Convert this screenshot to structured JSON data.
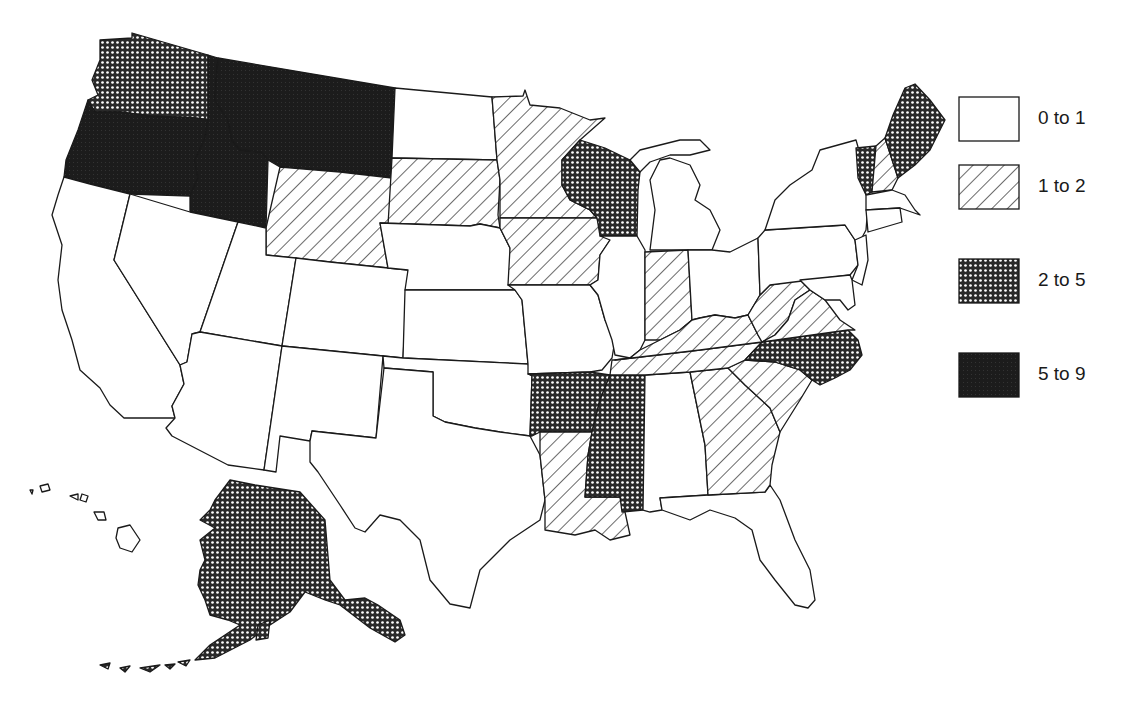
{
  "map": {
    "type": "choropleth",
    "region": "United States",
    "legend": [
      {
        "id": "c0",
        "label": "0 to 1",
        "pattern": "blank",
        "color": "#ffffff"
      },
      {
        "id": "c1",
        "label": "1 to 2",
        "pattern": "diagonal-hatch",
        "color": "#ffffff"
      },
      {
        "id": "c2",
        "label": "2 to 5",
        "pattern": "cross-hatch",
        "color": "#3a3a3a"
      },
      {
        "id": "c3",
        "label": "5 to 9",
        "pattern": "solid",
        "color": "#1c1c1c"
      }
    ],
    "states": {
      "5 to 9": [
        "Oregon",
        "Idaho",
        "Montana"
      ],
      "2 to 5": [
        "Washington",
        "Wisconsin",
        "Arkansas",
        "Mississippi",
        "North Carolina",
        "Vermont",
        "Maine",
        "Alaska"
      ],
      "1 to 2": [
        "Wyoming",
        "South Dakota",
        "Minnesota",
        "Iowa",
        "Indiana",
        "Kentucky",
        "Tennessee",
        "West Virginia",
        "Virginia",
        "Louisiana",
        "Georgia",
        "South Carolina",
        "New Hampshire"
      ],
      "0 to 1": [
        "California",
        "Nevada",
        "Utah",
        "Arizona",
        "Colorado",
        "New Mexico",
        "North Dakota",
        "Nebraska",
        "Kansas",
        "Oklahoma",
        "Texas",
        "Missouri",
        "Illinois",
        "Michigan",
        "Ohio",
        "Pennsylvania",
        "New York",
        "New Jersey",
        "Delaware",
        "Maryland",
        "Connecticut",
        "Rhode Island",
        "Massachusetts",
        "Alabama",
        "Florida",
        "Hawaii"
      ]
    }
  }
}
